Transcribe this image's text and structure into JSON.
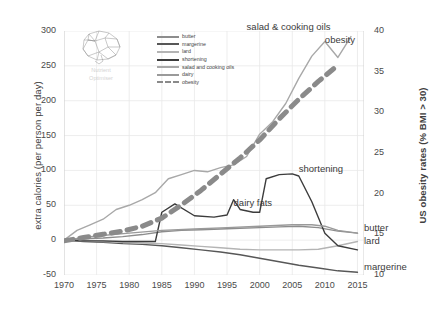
{
  "chart_data": {
    "type": "line",
    "title": "",
    "xlabel": "",
    "ylabel": "extra calories (per person per day)",
    "y2label": "US obesity rates (% BMI > 30)",
    "xlim": [
      1970,
      2016
    ],
    "ylim": [
      -50,
      300
    ],
    "y2lim": [
      10,
      40
    ],
    "xticks": [
      "1970",
      "1975",
      "1980",
      "1985",
      "1990",
      "1995",
      "2000",
      "2005",
      "2010",
      "2015"
    ],
    "yticks": [
      "-50",
      "0",
      "50",
      "100",
      "150",
      "200",
      "250",
      "300"
    ],
    "y2ticks": [
      "10",
      "15",
      "20",
      "25",
      "30",
      "35",
      "40"
    ],
    "grid": true,
    "legend_position": "top-center-inside",
    "series": [
      {
        "name": "butter",
        "color": "#8d8d8d",
        "axis": "left",
        "x": [
          1970,
          1973,
          1976,
          1979,
          1982,
          1985,
          1988,
          1991,
          1994,
          1997,
          2000,
          2003,
          2006,
          2009,
          2012,
          2015
        ],
        "values": [
          0,
          2,
          3,
          5,
          8,
          12,
          14,
          15,
          16,
          17,
          18,
          19,
          20,
          18,
          13,
          10
        ]
      },
      {
        "name": "margerine",
        "color": "#575757",
        "axis": "left",
        "x": [
          1970,
          1973,
          1976,
          1979,
          1982,
          1985,
          1988,
          1991,
          1994,
          1997,
          2000,
          2003,
          2006,
          2009,
          2012,
          2015
        ],
        "values": [
          0,
          -2,
          -3,
          -5,
          -6,
          -8,
          -11,
          -14,
          -17,
          -21,
          -26,
          -31,
          -36,
          -40,
          -44,
          -46
        ]
      },
      {
        "name": "lard",
        "color": "#b4b4b4",
        "axis": "left",
        "x": [
          1970,
          1973,
          1976,
          1979,
          1982,
          1985,
          1988,
          1991,
          1994,
          1997,
          2000,
          2003,
          2006,
          2009,
          2012,
          2015
        ],
        "values": [
          0,
          -1,
          -2,
          -3,
          -4,
          -5,
          -7,
          -9,
          -11,
          -13,
          -14,
          -14,
          -14,
          -13,
          -8,
          -2
        ]
      },
      {
        "name": "shortening",
        "color": "#3c3c3c",
        "axis": "left",
        "x": [
          1970,
          1973,
          1976,
          1979,
          1982,
          1984,
          1985,
          1987,
          1990,
          1993,
          1995,
          1996,
          1997,
          1999,
          2000,
          2001,
          2003,
          2005,
          2006,
          2008,
          2010,
          2012,
          2015
        ],
        "values": [
          0,
          -1,
          -1,
          -2,
          -2,
          -2,
          40,
          52,
          35,
          33,
          36,
          58,
          44,
          40,
          40,
          88,
          94,
          95,
          92,
          55,
          10,
          -8,
          -14
        ]
      },
      {
        "name": "salad and cooking oils",
        "color": "#a8a8a8",
        "axis": "left",
        "x": [
          1970,
          1972,
          1974,
          1976,
          1978,
          1980,
          1982,
          1984,
          1986,
          1988,
          1990,
          1992,
          1994,
          1996,
          1998,
          2000,
          2002,
          2004,
          2006,
          2008,
          2010,
          2012,
          2014
        ],
        "values": [
          0,
          14,
          22,
          30,
          44,
          50,
          58,
          68,
          88,
          94,
          100,
          98,
          104,
          108,
          120,
          152,
          170,
          196,
          232,
          264,
          285,
          262,
          292
        ]
      },
      {
        "name": "dairy",
        "color": "#9a9a9a",
        "axis": "left",
        "x": [
          1970,
          1975,
          1980,
          1985,
          1990,
          1995,
          2000,
          2005,
          2008,
          2010,
          2012,
          2015
        ],
        "values": [
          0,
          6,
          10,
          14,
          16,
          18,
          20,
          22,
          22,
          20,
          14,
          10
        ]
      },
      {
        "name": "obesity",
        "color": "#8a8a8a",
        "axis": "right",
        "style": "dashed",
        "x": [
          1970,
          1973,
          1976,
          1979,
          1982,
          1985,
          1988,
          1991,
          1994,
          1997,
          2000,
          2003,
          2006,
          2009,
          2012
        ],
        "values": [
          14.2,
          14.6,
          15.0,
          15.4,
          16.0,
          17.0,
          18.6,
          20.4,
          22.4,
          24.4,
          26.6,
          29.2,
          31.6,
          33.8,
          35.8
        ]
      }
    ],
    "annotations": [
      {
        "text": "salad & cooking oils",
        "x": 1998,
        "y": 305
      },
      {
        "text": "obesity",
        "x": 2010,
        "y": 285
      },
      {
        "text": "shortening",
        "x": 2006,
        "y": 100
      },
      {
        "text": "dairy fats",
        "x": 1996,
        "y": 52
      },
      {
        "text": "butter",
        "x": 2016,
        "y": 16
      },
      {
        "text": "lard",
        "x": 2016,
        "y": -2
      },
      {
        "text": "margerine",
        "x": 2016,
        "y": -40
      }
    ]
  },
  "legend": {
    "items": [
      {
        "label": "butter",
        "color": "#8d8d8d",
        "style": "solid"
      },
      {
        "label": "margerine",
        "color": "#575757",
        "style": "solid"
      },
      {
        "label": "lard",
        "color": "#b4b4b4",
        "style": "solid"
      },
      {
        "label": "shortening",
        "color": "#3c3c3c",
        "style": "solid"
      },
      {
        "label": "salad and cooking oils",
        "color": "#a8a8a8",
        "style": "solid"
      },
      {
        "label": "dairy",
        "color": "#9a9a9a",
        "style": "solid"
      },
      {
        "label": "obesity",
        "color": "#8a8a8a",
        "style": "dashed"
      }
    ]
  },
  "watermark": {
    "line1": "Nutrient",
    "line2": "Optimiser",
    "icon": "brain-icon"
  },
  "colors": {
    "grid": "#e8e8e8",
    "axis": "#d0d0d0",
    "text": "#404040"
  }
}
